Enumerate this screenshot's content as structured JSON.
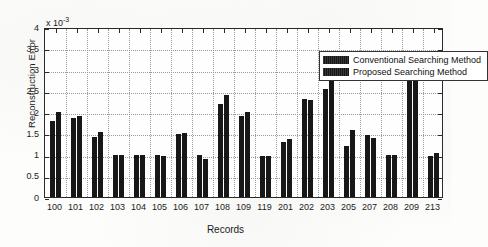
{
  "chart_data": {
    "type": "bar",
    "title": "",
    "xlabel": "Records",
    "ylabel": "Reconstruction Error",
    "y_multiplier": "x 10",
    "y_multiplier_exp": "-3",
    "ylim": [
      0,
      4
    ],
    "yticks": [
      "0",
      "0.5",
      "1",
      "1.5",
      "2",
      "2.5",
      "3",
      "3.5",
      "4"
    ],
    "ytick_values": [
      0,
      0.5,
      1,
      1.5,
      2,
      2.5,
      3,
      3.5,
      4
    ],
    "grid": true,
    "legend_position": "top-right",
    "categories": [
      "100",
      "101",
      "102",
      "103",
      "104",
      "105",
      "106",
      "107",
      "108",
      "109",
      "119",
      "201",
      "202",
      "203",
      "205",
      "207",
      "208",
      "209",
      "213"
    ],
    "series": [
      {
        "name": "Conventional Searching Method",
        "color": "#171717",
        "values": [
          1.79,
          1.87,
          1.42,
          0.98,
          0.98,
          0.98,
          1.48,
          0.98,
          2.19,
          1.9,
          0.97,
          1.29,
          2.3,
          2.53,
          1.19,
          1.47,
          0.98,
          3.1,
          0.97
        ]
      },
      {
        "name": "Proposed Searching Method",
        "color": "#171717",
        "values": [
          2.01,
          1.9,
          1.53,
          0.98,
          0.98,
          0.97,
          1.5,
          0.9,
          2.4,
          1.99,
          0.97,
          1.36,
          2.28,
          2.76,
          1.58,
          1.39,
          0.98,
          3.27,
          1.03
        ]
      }
    ]
  },
  "legend": {
    "items": [
      {
        "label": "Conventional Searching Method"
      },
      {
        "label": "Proposed Searching Method"
      }
    ]
  }
}
